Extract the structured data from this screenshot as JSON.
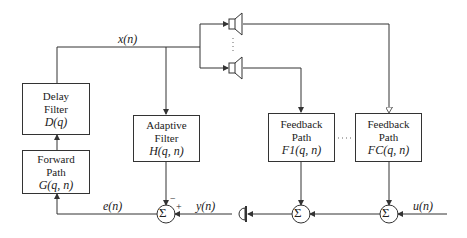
{
  "blocks": {
    "delay": {
      "line1": "Delay",
      "line2": "Filter",
      "math": "D(q)"
    },
    "forward": {
      "line1": "Forward",
      "line2": "Path",
      "math": "G(q, n)"
    },
    "adaptive": {
      "line1": "Adaptive",
      "line2": "Filter",
      "math": "H(q, n)"
    },
    "feedback1": {
      "line1": "Feedback",
      "line2": "Path",
      "math": "F1(q, n)"
    },
    "feedbackC": {
      "line1": "Feedback",
      "line2": "Path",
      "math": "FC(q, n)"
    }
  },
  "signals": {
    "x": "x(n)",
    "e": "e(n)",
    "y": "y(n)",
    "u": "u(n)"
  },
  "summer_symbol": "Σ",
  "signs": {
    "minus": "−",
    "plus": "+"
  },
  "ellipsis": "···",
  "vertical_ellipsis": "⋮"
}
